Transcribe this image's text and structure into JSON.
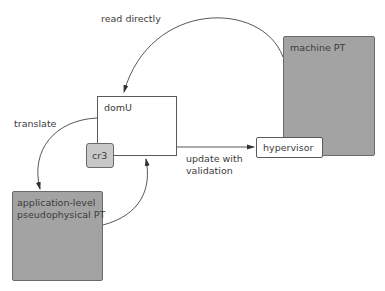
{
  "diagram": {
    "nodes": {
      "domU": {
        "label": "domU",
        "fill": "#ffffff"
      },
      "cr3": {
        "label": "cr3",
        "fill": "#c8c8c8"
      },
      "machine_pt": {
        "label": "machine PT",
        "fill": "#a3a3a3"
      },
      "hypervisor": {
        "label": "hypervisor",
        "fill": "#ffffff"
      },
      "app_pt": {
        "label": "application-level\npseudophysical PT",
        "fill": "#a3a3a3"
      }
    },
    "edges": [
      {
        "from": "machine_pt",
        "to": "domU",
        "label": "read directly"
      },
      {
        "from": "domU",
        "to": "app_pt",
        "label": "translate"
      },
      {
        "from": "app_pt",
        "to": "domU",
        "label": ""
      },
      {
        "from": "domU",
        "to": "hypervisor",
        "label": "update with\nvalidation"
      }
    ]
  }
}
